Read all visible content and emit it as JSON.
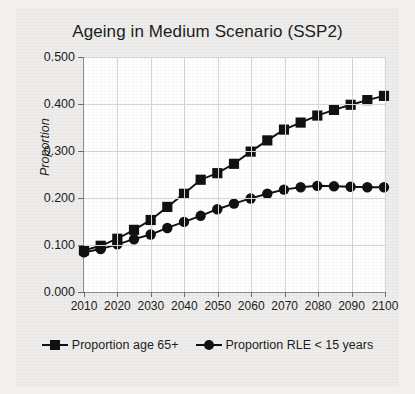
{
  "chart_data": {
    "type": "line",
    "title": "Ageing in Medium Scenario (SSP2)",
    "xlabel": "",
    "ylabel": "Proportion",
    "xlim": [
      2010,
      2100
    ],
    "ylim": [
      0.0,
      0.5
    ],
    "grid": true,
    "legend_position": "bottom",
    "x_ticks": [
      "2010",
      "2020",
      "2030",
      "2040",
      "2050",
      "2060",
      "2070",
      "2080",
      "2090",
      "2100"
    ],
    "y_ticks": [
      "0.000",
      "0.100",
      "0.200",
      "0.300",
      "0.400",
      "0.500"
    ],
    "x": [
      2010,
      2015,
      2020,
      2025,
      2030,
      2035,
      2040,
      2045,
      2050,
      2055,
      2060,
      2065,
      2070,
      2075,
      2080,
      2085,
      2090,
      2095,
      2100
    ],
    "series": [
      {
        "name": "Proportion age 65+",
        "marker": "square",
        "color": "#111111",
        "values": [
          0.087,
          0.097,
          0.112,
          0.131,
          0.152,
          0.18,
          0.208,
          0.238,
          0.252,
          0.272,
          0.298,
          0.322,
          0.345,
          0.36,
          0.375,
          0.387,
          0.398,
          0.408,
          0.417
        ]
      },
      {
        "name": "Proportion RLE < 15 years",
        "marker": "circle",
        "color": "#111111",
        "values": [
          0.083,
          0.09,
          0.1,
          0.111,
          0.121,
          0.135,
          0.148,
          0.161,
          0.175,
          0.187,
          0.198,
          0.208,
          0.217,
          0.222,
          0.225,
          0.224,
          0.223,
          0.222,
          0.222
        ]
      }
    ]
  },
  "legend": {
    "entries": [
      {
        "label": "Proportion age 65+",
        "marker": "square"
      },
      {
        "label": "Proportion RLE < 15 years",
        "marker": "circle"
      }
    ]
  }
}
